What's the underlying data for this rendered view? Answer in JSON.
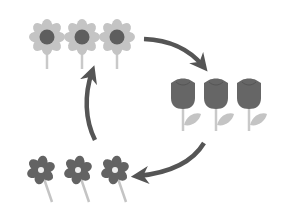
{
  "diagram": {
    "colors": {
      "background": "#ffffff",
      "arrow": "#555555",
      "sunflower_petal": "#c4c4c4",
      "sunflower_center": "#5e5e5e",
      "sunflower_stem": "#c9c9c9",
      "tulip_cup": "#666666",
      "tulip_stem": "#c9c9c9",
      "tulip_leaf": "#c4c4c4",
      "daisy_petal": "#636363",
      "daisy_center": "#eeeeee",
      "daisy_stem": "#c4c4c4"
    },
    "groups": [
      {
        "name": "sunflowers",
        "kind": "sunflower",
        "count": 3
      },
      {
        "name": "tulips",
        "kind": "tulip",
        "count": 3
      },
      {
        "name": "daisies",
        "kind": "daisy",
        "count": 3
      }
    ],
    "arrows": [
      {
        "from": "sunflowers",
        "to": "tulips"
      },
      {
        "from": "tulips",
        "to": "daisies"
      },
      {
        "from": "daisies",
        "to": "sunflowers"
      }
    ]
  }
}
